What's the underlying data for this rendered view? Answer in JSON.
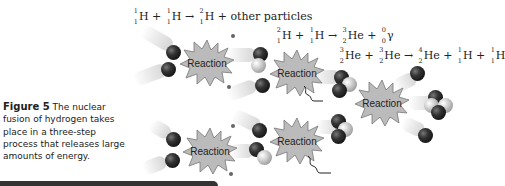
{
  "figure": {
    "label": "Figure 5",
    "caption": "The nuclear fusion of hydrogen takes place in a three-step process that releases large amounts of energy."
  },
  "equations": [
    {
      "id": "step1",
      "terms": [
        {
          "a": "1",
          "z": "1",
          "sym": "H"
        },
        {
          "op": "+"
        },
        {
          "a": "1",
          "z": "1",
          "sym": "H"
        },
        {
          "op": "→"
        },
        {
          "a": "2",
          "z": "1",
          "sym": "H"
        },
        {
          "op": "+"
        },
        {
          "text": "other particles"
        }
      ]
    },
    {
      "id": "step2",
      "terms": [
        {
          "a": "2",
          "z": "1",
          "sym": "H"
        },
        {
          "op": "+"
        },
        {
          "a": "1",
          "z": "1",
          "sym": "H"
        },
        {
          "op": "→"
        },
        {
          "a": "3",
          "z": "2",
          "sym": "He"
        },
        {
          "op": "+"
        },
        {
          "a": "0",
          "z": "0",
          "sym": "γ"
        }
      ]
    },
    {
      "id": "step3",
      "terms": [
        {
          "a": "3",
          "z": "2",
          "sym": "He"
        },
        {
          "op": "+"
        },
        {
          "a": "3",
          "z": "2",
          "sym": "He"
        },
        {
          "op": "→"
        },
        {
          "a": "4",
          "z": "2",
          "sym": "He"
        },
        {
          "op": "+"
        },
        {
          "a": "1",
          "z": "1",
          "sym": "H"
        },
        {
          "op": "+"
        },
        {
          "a": "1",
          "z": "1",
          "sym": "H"
        }
      ]
    }
  ],
  "reactions": [
    {
      "label": "Reaction"
    },
    {
      "label": "Reaction"
    },
    {
      "label": "Reaction"
    },
    {
      "label": "Reaction"
    },
    {
      "label": "Reaction"
    }
  ]
}
